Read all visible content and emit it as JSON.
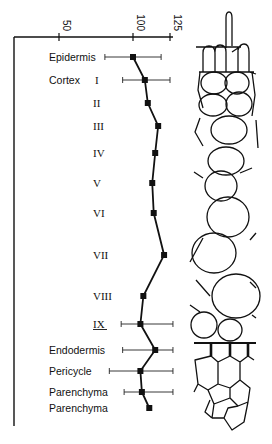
{
  "figure": {
    "axis_ticks": [
      {
        "label": "50",
        "value": 50
      },
      {
        "label": "100",
        "value": 100
      },
      {
        "label": "125",
        "value": 125
      }
    ]
  },
  "chart_data": {
    "type": "line",
    "orientation": "horizontal-value-axis-top",
    "title": "",
    "xlabel": "",
    "ylabel": "",
    "x_axis_position": "top",
    "xlim": [
      37,
      127
    ],
    "xticks": [
      50,
      100,
      125
    ],
    "grid": false,
    "legend": null,
    "categories": [
      {
        "group": "Epidermis",
        "label": "Epidermis",
        "sub": ""
      },
      {
        "group": "Cortex",
        "label": "Cortex",
        "sub": "I"
      },
      {
        "group": "Cortex",
        "label": "",
        "sub": "II"
      },
      {
        "group": "Cortex",
        "label": "",
        "sub": "III"
      },
      {
        "group": "Cortex",
        "label": "",
        "sub": "IV"
      },
      {
        "group": "Cortex",
        "label": "",
        "sub": "V"
      },
      {
        "group": "Cortex",
        "label": "",
        "sub": "VI"
      },
      {
        "group": "Cortex",
        "label": "",
        "sub": "VII"
      },
      {
        "group": "Cortex",
        "label": "",
        "sub": "VIII"
      },
      {
        "group": "Cortex",
        "label": "",
        "sub": "IX"
      },
      {
        "group": "Endodermis",
        "label": "Endodermis",
        "sub": ""
      },
      {
        "group": "Pericycle",
        "label": "Pericycle",
        "sub": ""
      },
      {
        "group": "Parenchyma",
        "label": "Parenchyma",
        "sub": ""
      },
      {
        "group": "Parenchyma",
        "label": "Parenchyma",
        "sub": ""
      }
    ],
    "series": [
      {
        "name": "tissue value",
        "values": [
          100,
          108,
          110,
          117,
          115,
          113,
          114,
          121,
          107,
          105,
          115,
          105,
          106,
          111
        ],
        "error_low": [
          81,
          93,
          null,
          null,
          null,
          null,
          null,
          null,
          null,
          92,
          93,
          84,
          94,
          null
        ],
        "error_high": [
          119,
          125,
          null,
          null,
          null,
          null,
          null,
          null,
          null,
          127,
          127,
          127,
          127,
          null
        ]
      }
    ],
    "annotations": [
      "IX label underlined",
      "schematic cross-section drawing of root tissues on right"
    ]
  }
}
